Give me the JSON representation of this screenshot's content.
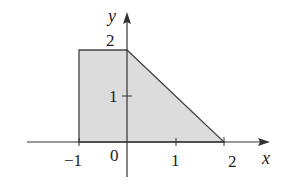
{
  "diagram": {
    "type": "region-plot",
    "axes": {
      "x_label": "x",
      "y_label": "y",
      "origin_label": "0",
      "x_ticks": [
        {
          "value": -1,
          "label": "−1"
        },
        {
          "value": 1,
          "label": "1"
        },
        {
          "value": 2,
          "label": "2"
        }
      ],
      "y_ticks": [
        {
          "value": 1,
          "label": "1"
        },
        {
          "value": 2,
          "label": "2"
        }
      ]
    },
    "region": {
      "vertices": [
        [
          -1,
          0
        ],
        [
          -1,
          2
        ],
        [
          0,
          2
        ],
        [
          2,
          0
        ]
      ],
      "fill": "#dcdcdc",
      "stroke": "#444444"
    },
    "colors": {
      "axis": "#333333",
      "region_fill": "#dcdcdc",
      "region_stroke": "#444444"
    }
  }
}
